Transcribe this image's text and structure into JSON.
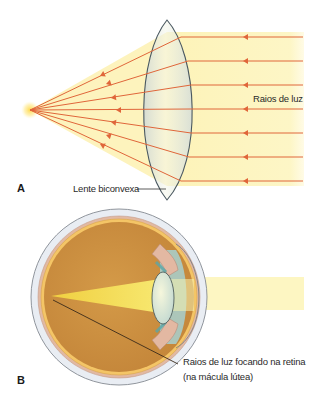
{
  "panel_a": {
    "letter": "A",
    "rays_label": "Raios de luz",
    "lens_label": "Lente biconvexa",
    "ray_count": 7,
    "ray_y": [
      37,
      61,
      85,
      109,
      133,
      157,
      181
    ],
    "focal_point": [
      30,
      110
    ]
  },
  "panel_b": {
    "letter": "B",
    "focus_label_line1": "Raios de luz focando na retina",
    "focus_label_line2": "(na mácula lútea)"
  },
  "colors": {
    "ray": "#e0663a",
    "light_beam": "#fdf5c0",
    "lens_outline": "#4a5860",
    "lens_fill": "#e6ece8",
    "sclera": "#e9edf3",
    "choroid": "#e2b9a2",
    "retina": "#f4c566",
    "vitreous": "#c98c3a",
    "focus_beam": "#f2dc52"
  }
}
